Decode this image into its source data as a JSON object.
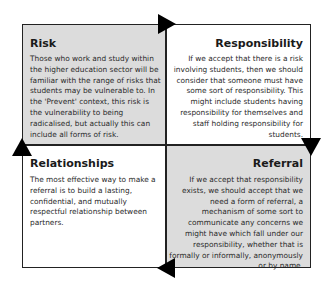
{
  "diagram": {
    "type": "cycle-quadrant",
    "flow": "clockwise",
    "quadrants": [
      {
        "id": "risk",
        "position": "top-left",
        "shaded": true,
        "title": "Risk",
        "body": "Those who work and study within the higher education sector will be familiar with the range of risks that students may be vulnerable to. In the 'Prevent' context, this risk is the vulnerability to being radicalised, but actually this can include all forms of risk."
      },
      {
        "id": "responsibility",
        "position": "top-right",
        "shaded": false,
        "title": "Responsibility",
        "body": "If we accept that there is a risk involving students, then we should consider that someone must have some sort of responsibility. This might include students having responsibility for themselves and staff holding responsibility for students."
      },
      {
        "id": "relationships",
        "position": "bottom-left",
        "shaded": false,
        "title": "Relationships",
        "body": "The most effective way to make a referral is to build a lasting, confidential, and mutually respectful relationship between partners."
      },
      {
        "id": "referral",
        "position": "bottom-right",
        "shaded": true,
        "title": "Referral",
        "body": "If we accept that responsibility exists, we should accept that we need a form of referral, a mechanism of some sort to communicate any concerns we might have which fall under our responsibility, whether that is formally or informally, anonymously or by name."
      }
    ],
    "arrows": [
      {
        "from": "risk",
        "to": "responsibility",
        "direction": "right"
      },
      {
        "from": "responsibility",
        "to": "referral",
        "direction": "down"
      },
      {
        "from": "referral",
        "to": "relationships",
        "direction": "left"
      },
      {
        "from": "relationships",
        "to": "risk",
        "direction": "up"
      }
    ],
    "colors": {
      "shaded_fill": "#dcdcdc",
      "plain_fill": "#ffffff",
      "line": "#222222",
      "arrow": "#000000"
    }
  }
}
